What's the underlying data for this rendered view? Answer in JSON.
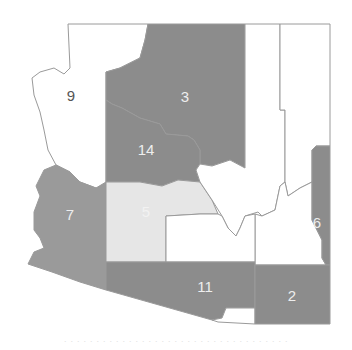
{
  "map": {
    "title": "Arizona congressional districts",
    "colors": {
      "dark": "#8c8c8c",
      "medium": "#9a9a9a",
      "light": "#e6e6e6",
      "white": "#ffffff",
      "border": "#9a9a9a",
      "label_dark": "#555555",
      "label_light": "#eeeeee"
    },
    "districts": [
      {
        "id": "9",
        "label": "9",
        "fill": "white"
      },
      {
        "id": "3",
        "label": "3",
        "fill": "dark"
      },
      {
        "id": "14",
        "label": "14",
        "fill": "dark"
      },
      {
        "id": "7",
        "label": "7",
        "fill": "medium"
      },
      {
        "id": "5",
        "label": "5",
        "fill": "light"
      },
      {
        "id": "11",
        "label": "11",
        "fill": "dark"
      },
      {
        "id": "2",
        "label": "2",
        "fill": "dark"
      },
      {
        "id": "6",
        "label": "6",
        "fill": "dark"
      },
      {
        "id": "north-central",
        "label": "",
        "fill": "white"
      },
      {
        "id": "northeast",
        "label": "",
        "fill": "white"
      },
      {
        "id": "central",
        "label": "",
        "fill": "white"
      },
      {
        "id": "south-central",
        "label": "",
        "fill": "white"
      },
      {
        "id": "southeast-white",
        "label": "",
        "fill": "white"
      },
      {
        "id": "border-pocket",
        "label": "",
        "fill": "white"
      }
    ]
  },
  "caption": "· · · · · · · · · · · · · · · · · · · · · · · · · · · · · · · · · · ·"
}
